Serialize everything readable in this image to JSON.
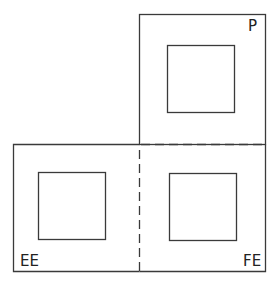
{
  "diagram": {
    "stroke_color": "#3a3a3a",
    "regions": [
      {
        "id": "P",
        "label": "P",
        "position": "top-right"
      },
      {
        "id": "EE",
        "label": "EE",
        "position": "bottom-left"
      },
      {
        "id": "FE",
        "label": "FE",
        "position": "bottom-right"
      }
    ],
    "dividers": {
      "horizontal": "dashed",
      "vertical": "dashed"
    }
  }
}
